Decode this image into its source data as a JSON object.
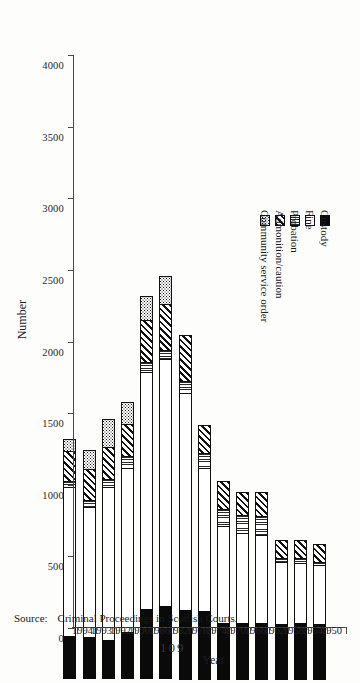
{
  "page": {
    "folio": "109"
  },
  "source": {
    "label": "Source:",
    "text": "Criminal Proceedings in Scottish Courts."
  },
  "axes": {
    "value_title": "Number",
    "category_title": "Year",
    "value_ticks": [
      "4000",
      "3500",
      "3000",
      "2500",
      "2000",
      "1500",
      "1000",
      "500",
      "0"
    ]
  },
  "legend": {
    "items": [
      {
        "label": "Community service order",
        "key": "cso"
      },
      {
        "label": "Admonition/caution",
        "key": "adm"
      },
      {
        "label": "Probation",
        "key": "prob"
      },
      {
        "label": "Fine",
        "key": "fine"
      },
      {
        "label": "Custody",
        "key": "cust"
      }
    ]
  },
  "chart_data": {
    "type": "bar",
    "orientation": "horizontal-rotated",
    "stacked": true,
    "title": "",
    "xlabel": "Year",
    "ylabel": "Number",
    "ylim": [
      0,
      4000
    ],
    "ytick_step": 500,
    "grid": false,
    "legend_position": "top-left",
    "categories": [
      "1950",
      "1954",
      "1958",
      "1962",
      "1966",
      "1970",
      "1974",
      "1978",
      "1982",
      "1986",
      "1990",
      "1992",
      "1993",
      "1994"
    ],
    "series": [
      {
        "name": "Custody",
        "key": "cust",
        "values": [
          390,
          395,
          390,
          400,
          395,
          400,
          480,
          490,
          510,
          490,
          330,
          270,
          290,
          300
        ]
      },
      {
        "name": "Fine",
        "key": "fine",
        "values": [
          420,
          430,
          440,
          620,
          640,
          680,
          1010,
          1520,
          1730,
          1660,
          1150,
          1080,
          920,
          1050
        ]
      },
      {
        "name": "Probation",
        "key": "prob",
        "values": [
          30,
          40,
          35,
          140,
          130,
          130,
          110,
          90,
          70,
          80,
          90,
          60,
          50,
          45
        ]
      },
      {
        "name": "Admonition/caution",
        "key": "adm",
        "values": [
          130,
          130,
          130,
          170,
          170,
          200,
          200,
          330,
          330,
          300,
          230,
          230,
          230,
          220
        ]
      },
      {
        "name": "Community service order",
        "key": "cso",
        "values": [
          0,
          0,
          0,
          0,
          0,
          0,
          0,
          0,
          200,
          170,
          160,
          200,
          140,
          90
        ]
      }
    ],
    "totals": [
      970,
      995,
      995,
      1330,
      1335,
      1410,
      1800,
      2430,
      2840,
      2700,
      1960,
      1840,
      1630,
      1705
    ]
  }
}
